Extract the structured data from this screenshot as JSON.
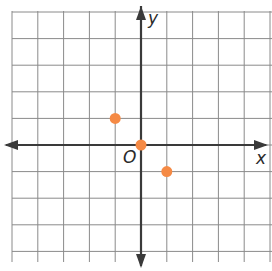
{
  "chart_data": {
    "type": "scatter",
    "title": "",
    "xlabel": "x",
    "ylabel": "y",
    "origin_label": "O",
    "xlim": [
      -5,
      5
    ],
    "ylim": [
      -5,
      5
    ],
    "grid": true,
    "tick_labels": false,
    "points": [
      {
        "x": -1,
        "y": 1
      },
      {
        "x": 0,
        "y": 0
      },
      {
        "x": 1,
        "y": -1
      }
    ],
    "colors": {
      "point": "#f58a45",
      "axis": "#3a3a3a",
      "grid": "#8a8a8a"
    }
  }
}
